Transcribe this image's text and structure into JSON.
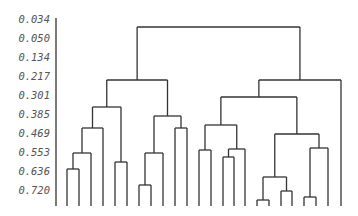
{
  "chart_data": {
    "type": "dendrogram",
    "title": "",
    "xlabel": "",
    "ylabel": "",
    "y_tick_labels": [
      "0.034",
      "0.050",
      "0.134",
      "0.217",
      "0.301",
      "0.385",
      "0.469",
      "0.553",
      "0.636",
      "0.720"
    ],
    "grid": false,
    "legend": null,
    "leaf_count": 24,
    "leaf_labels_visible": false,
    "colors": {
      "line": "#333333",
      "tick_text": "#555555",
      "background": "#ffffff"
    },
    "axis": {
      "x": 56,
      "y_top": 18,
      "y_bottom": 206
    },
    "ticks_y": [
      19,
      38,
      57,
      76,
      95,
      114,
      133,
      152,
      171,
      190
    ],
    "baseline": 206,
    "leaves_x": [
      67,
      79,
      91,
      103,
      115,
      127,
      139,
      151,
      163,
      175,
      187,
      199,
      211,
      223,
      234,
      245,
      257,
      269,
      281,
      292,
      304,
      316,
      328,
      341
    ],
    "merges": [
      {
        "id": "a",
        "left": {
          "leaf": 0
        },
        "right": {
          "leaf": 1
        },
        "y": 169
      },
      {
        "id": "b",
        "left": {
          "node": "a"
        },
        "right": {
          "leaf": 2
        },
        "y": 153
      },
      {
        "id": "c",
        "left": {
          "node": "b"
        },
        "right": {
          "leaf": 3
        },
        "y": 128
      },
      {
        "id": "d",
        "left": {
          "leaf": 4
        },
        "right": {
          "leaf": 5
        },
        "y": 162
      },
      {
        "id": "e",
        "left": {
          "node": "c"
        },
        "right": {
          "node": "d"
        },
        "y": 107
      },
      {
        "id": "f",
        "left": {
          "leaf": 6
        },
        "right": {
          "leaf": 7
        },
        "y": 185
      },
      {
        "id": "g",
        "left": {
          "node": "f"
        },
        "right": {
          "leaf": 8
        },
        "y": 153
      },
      {
        "id": "h",
        "left": {
          "leaf": 9
        },
        "right": {
          "leaf": 10
        },
        "y": 128
      },
      {
        "id": "i",
        "left": {
          "node": "g"
        },
        "right": {
          "node": "h"
        },
        "y": 116
      },
      {
        "id": "j",
        "left": {
          "node": "e"
        },
        "right": {
          "node": "i"
        },
        "y": 80
      },
      {
        "id": "k",
        "left": {
          "leaf": 11
        },
        "right": {
          "leaf": 12
        },
        "y": 150
      },
      {
        "id": "l",
        "left": {
          "leaf": 13
        },
        "right": {
          "leaf": 14
        },
        "y": 157
      },
      {
        "id": "m",
        "left": {
          "node": "l"
        },
        "right": {
          "leaf": 15
        },
        "y": 149
      },
      {
        "id": "n",
        "left": {
          "node": "k"
        },
        "right": {
          "node": "m"
        },
        "y": 125
      },
      {
        "id": "o",
        "left": {
          "leaf": 16
        },
        "right": {
          "leaf": 17
        },
        "y": 200
      },
      {
        "id": "p",
        "left": {
          "leaf": 18
        },
        "right": {
          "leaf": 19
        },
        "y": 191
      },
      {
        "id": "q",
        "left": {
          "node": "o"
        },
        "right": {
          "node": "p"
        },
        "y": 177
      },
      {
        "id": "r",
        "left": {
          "leaf": 20
        },
        "right": {
          "leaf": 21
        },
        "y": 197
      },
      {
        "id": "s",
        "left": {
          "node": "r"
        },
        "right": {
          "leaf": 22
        },
        "y": 148
      },
      {
        "id": "t",
        "left": {
          "node": "q"
        },
        "right": {
          "node": "s"
        },
        "y": 134
      },
      {
        "id": "u",
        "left": {
          "node": "n"
        },
        "right": {
          "node": "t"
        },
        "y": 97
      },
      {
        "id": "v",
        "left": {
          "node": "u"
        },
        "right": {
          "leaf": 23
        },
        "y": 80
      },
      {
        "id": "w",
        "left": {
          "node": "j"
        },
        "right": {
          "node": "v"
        },
        "y": 27
      }
    ]
  }
}
